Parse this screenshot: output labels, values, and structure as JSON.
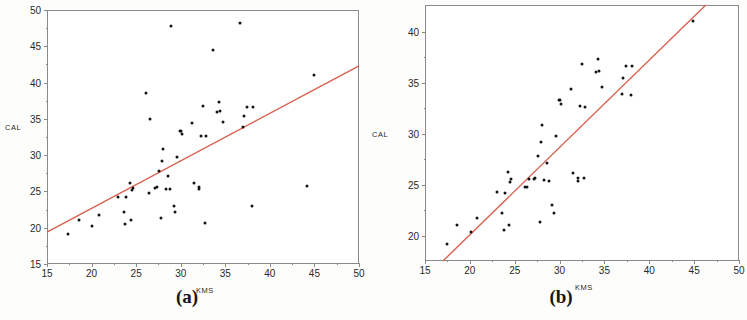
{
  "figure": {
    "background": "#ffffff",
    "point_color": "#141414",
    "line_color": "#d9604f",
    "axis_color": "#8a8a8a"
  },
  "chart_data": [
    {
      "id": "panel-a",
      "type": "scatter",
      "caption": "(a)",
      "title": "",
      "xlabel": "KMS",
      "ylabel": "CAL",
      "xlim": [
        15,
        50
      ],
      "ylim": [
        15,
        50
      ],
      "xticks": [
        15,
        20,
        25,
        30,
        35,
        40,
        45,
        50
      ],
      "yticks": [
        15,
        20,
        25,
        30,
        35,
        40,
        45,
        50
      ],
      "xticklabels": [
        "15",
        "20",
        "25",
        "30",
        "35",
        "40",
        "45",
        "50"
      ],
      "yticklabels": [
        "15",
        "20",
        "25",
        "30",
        "35",
        "40",
        "45",
        "50"
      ],
      "grid": false,
      "legend": "none",
      "x": [
        17.4,
        18.6,
        20.1,
        20.8,
        23.0,
        23.6,
        23.8,
        23.9,
        24.3,
        24.4,
        24.5,
        24.6,
        26.1,
        26.4,
        26.6,
        27.1,
        27.3,
        27.6,
        27.8,
        27.9,
        28.0,
        28.3,
        28.6,
        28.8,
        28.9,
        29.2,
        29.4,
        29.6,
        29.9,
        30.0,
        30.2,
        31.3,
        31.5,
        32.0,
        32.1,
        32.3,
        32.5,
        32.7,
        32.8,
        33.6,
        34.1,
        34.3,
        34.4,
        34.7,
        36.6,
        37.0,
        37.1,
        37.4,
        38.0,
        38.1,
        44.2,
        44.9
      ],
      "y": [
        19.2,
        21.0,
        20.3,
        21.7,
        24.3,
        22.2,
        20.5,
        24.2,
        26.2,
        21.0,
        25.2,
        25.5,
        38.5,
        24.8,
        35.0,
        25.5,
        25.6,
        27.8,
        21.3,
        29.2,
        30.8,
        25.4,
        27.1,
        25.3,
        47.8,
        23.0,
        22.2,
        29.8,
        33.3,
        33.3,
        32.9,
        34.4,
        26.1,
        25.3,
        25.6,
        32.7,
        36.8,
        20.6,
        32.6,
        44.5,
        36.0,
        37.3,
        36.1,
        34.6,
        48.2,
        33.9,
        35.4,
        36.6,
        23.0,
        36.6,
        25.8,
        41.0
      ],
      "regression_line": {
        "x_start": 15,
        "y_start": 19.4,
        "x_end": 50,
        "y_end": 42.3,
        "color": "#d9604f"
      }
    },
    {
      "id": "panel-b",
      "type": "scatter",
      "caption": "(b)",
      "title": "",
      "xlabel": "KMS",
      "ylabel": "CAL",
      "xlim": [
        15,
        50
      ],
      "ylim": [
        17.5,
        42.6
      ],
      "xticks": [
        15,
        20,
        25,
        30,
        35,
        40,
        45,
        50
      ],
      "yticks": [
        20,
        25,
        30,
        35,
        40
      ],
      "xticklabels": [
        "15",
        "20",
        "25",
        "30",
        "35",
        "40",
        "45",
        "50"
      ],
      "yticklabels": [
        "20",
        "25",
        "30",
        "35",
        "40"
      ],
      "grid": false,
      "legend": "none",
      "x": [
        17.4,
        18.6,
        20.1,
        20.8,
        23.0,
        23.6,
        23.8,
        23.9,
        24.3,
        24.4,
        24.5,
        24.6,
        26.1,
        26.4,
        26.6,
        27.1,
        27.3,
        27.6,
        27.8,
        27.9,
        28.0,
        28.3,
        28.6,
        28.8,
        29.2,
        29.4,
        29.6,
        29.9,
        30.0,
        30.2,
        31.3,
        31.5,
        32.0,
        32.1,
        32.3,
        32.5,
        32.7,
        32.8,
        34.1,
        34.3,
        34.4,
        34.7,
        37.0,
        37.1,
        37.4,
        38.0,
        38.1,
        44.9
      ],
      "y": [
        19.2,
        21.0,
        20.3,
        21.7,
        24.3,
        22.2,
        20.5,
        24.2,
        26.2,
        21.0,
        25.2,
        25.5,
        24.8,
        24.8,
        25.5,
        25.5,
        25.6,
        27.8,
        21.3,
        29.2,
        30.8,
        25.4,
        27.1,
        25.3,
        23.0,
        22.2,
        29.8,
        33.3,
        33.3,
        32.9,
        34.4,
        26.1,
        25.3,
        25.6,
        32.7,
        36.8,
        25.6,
        32.6,
        36.0,
        37.3,
        36.1,
        34.6,
        33.9,
        35.4,
        36.6,
        33.8,
        36.6,
        41.0
      ],
      "regression_line": {
        "x_start": 17.0,
        "y_start": 17.5,
        "x_end": 46.3,
        "y_end": 42.6,
        "color": "#d9604f"
      }
    }
  ]
}
